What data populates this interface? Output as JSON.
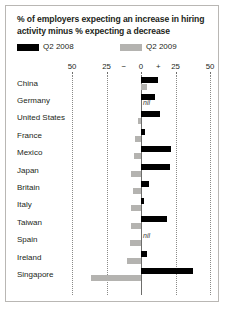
{
  "title": "% of employers expecting an increase in hiring activity minus % expecting a decrease",
  "legend": [
    {
      "label": "Q2 2008",
      "color": "#000000",
      "swatch": "legend-swatch-q2-2008"
    },
    {
      "label": "Q2 2009",
      "color": "#b4b3b0",
      "swatch": "legend-swatch-q2-2009"
    }
  ],
  "axis": {
    "labels": [
      "50",
      "25",
      "−",
      "0",
      "+",
      "25",
      "50"
    ],
    "values": [
      -50,
      -25,
      null,
      0,
      null,
      25,
      50
    ]
  },
  "nil_text": "nil",
  "chart_data": {
    "type": "bar",
    "orientation": "horizontal",
    "title": "% of employers expecting an increase in hiring activity minus % expecting a decrease",
    "xlabel": "",
    "ylabel": "",
    "xlim": [
      -50,
      50
    ],
    "grid": true,
    "legend_position": "top-left",
    "categories": [
      "China",
      "Germany",
      "United States",
      "France",
      "Mexico",
      "Japan",
      "Britain",
      "Italy",
      "Taiwan",
      "Spain",
      "Ireland",
      "Singapore"
    ],
    "series": [
      {
        "name": "Q2 2008",
        "color": "#000000",
        "values": [
          12,
          10,
          14,
          3,
          22,
          21,
          6,
          2,
          19,
          0,
          4,
          38
        ],
        "nil_indices": [
          9
        ]
      },
      {
        "name": "Q2 2009",
        "color": "#b4b3b0",
        "values": [
          4,
          0,
          -2,
          -4,
          -5,
          -7,
          -6,
          -7,
          -7,
          -8,
          -10,
          -36
        ],
        "nil_indices": [
          1
        ]
      }
    ]
  }
}
